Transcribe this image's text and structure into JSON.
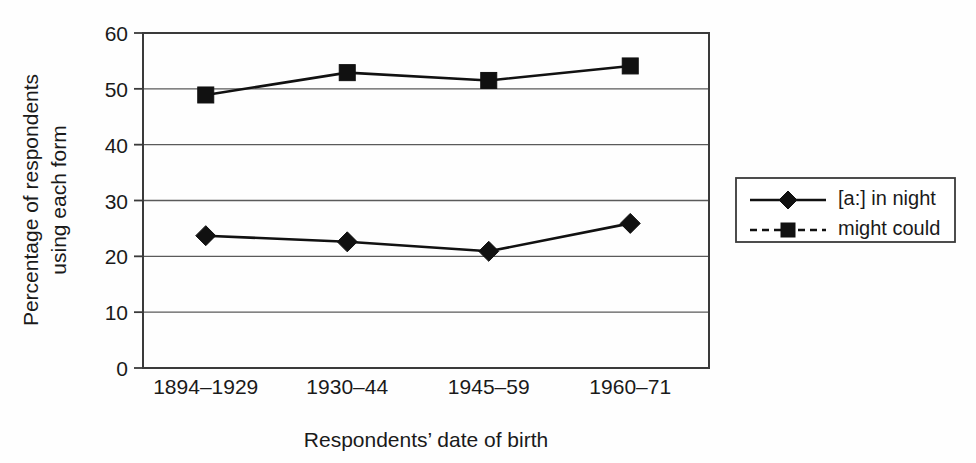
{
  "chart_data": {
    "type": "line",
    "title": "",
    "xlabel": "Respondents’ date of birth",
    "ylabel_line1": "Percentage of respondents",
    "ylabel_line2": "using each form",
    "categories": [
      "1894–1929",
      "1930–44",
      "1945–59",
      "1960–71"
    ],
    "ylim": [
      0,
      60
    ],
    "yticks": [
      0,
      10,
      20,
      30,
      40,
      50,
      60
    ],
    "ytick_labels": [
      "0",
      "10",
      "20",
      "30",
      "40",
      "50",
      "60"
    ],
    "grid": true,
    "legend_position": "right",
    "series": [
      {
        "name": "[a:] in night",
        "marker": "diamond",
        "linestyle": "solid",
        "color": "#111111",
        "values": [
          23.7,
          22.6,
          20.9,
          25.9
        ]
      },
      {
        "name": "might could",
        "marker": "square",
        "linestyle": "solid",
        "legend_linestyle": "dashed",
        "color": "#111111",
        "values": [
          48.9,
          52.9,
          51.5,
          54.1
        ]
      }
    ]
  },
  "legend": {
    "items": [
      {
        "label": "[a:] in night",
        "marker": "diamond",
        "linestyle": "solid"
      },
      {
        "label": "might could",
        "marker": "square",
        "linestyle": "dashed"
      }
    ]
  },
  "axes": {
    "y_title_line1": "Percentage of respondents",
    "y_title_line2": "using each form",
    "x_title": "Respondents’ date of birth"
  }
}
